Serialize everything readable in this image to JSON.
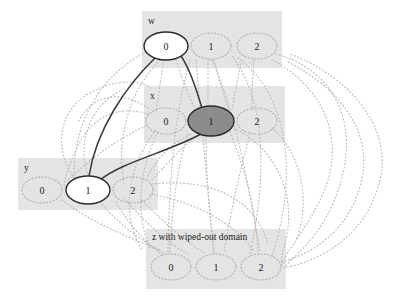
{
  "diagram": {
    "type": "constraint-graph",
    "title": "",
    "background_color": "#ffffff",
    "box_fill_color": "#e4e4e4",
    "dotted_edge_color": "#b9b9b9",
    "solid_edge_color": "#3a3a3a",
    "assigned_node_fill": "#ffffff",
    "highlight_node_fill": "#8c8c8c",
    "node_stroke_color": "#2a2a2a",
    "dotted_node_stroke_color": "#b0b0b0"
  },
  "variables": [
    {
      "id": "w",
      "label": "w",
      "label_x": 148,
      "label_y": 24,
      "box": {
        "x": 142,
        "y": 11,
        "w": 140,
        "h": 57
      },
      "values": [
        {
          "value": "0",
          "cx": 166,
          "cy": 46,
          "rx": 22,
          "ry": 14,
          "state": "assigned"
        },
        {
          "value": "1",
          "cx": 211,
          "cy": 46,
          "rx": 20,
          "ry": 13,
          "state": "available"
        },
        {
          "value": "2",
          "cx": 257,
          "cy": 46,
          "rx": 20,
          "ry": 13,
          "state": "available"
        }
      ]
    },
    {
      "id": "x",
      "label": "x",
      "label_x": 150,
      "label_y": 99,
      "box": {
        "x": 144,
        "y": 86,
        "w": 141,
        "h": 57
      },
      "values": [
        {
          "value": "0",
          "cx": 166,
          "cy": 121,
          "rx": 20,
          "ry": 13,
          "state": "available"
        },
        {
          "value": "1",
          "cx": 211,
          "cy": 121,
          "rx": 23,
          "ry": 15,
          "state": "highlighted"
        },
        {
          "value": "2",
          "cx": 257,
          "cy": 121,
          "rx": 20,
          "ry": 13,
          "state": "available"
        }
      ]
    },
    {
      "id": "y",
      "label": "y",
      "label_x": 24,
      "label_y": 171,
      "box": {
        "x": 18,
        "y": 158,
        "w": 140,
        "h": 52
      },
      "values": [
        {
          "value": "0",
          "cx": 42,
          "cy": 190,
          "rx": 20,
          "ry": 13,
          "state": "available"
        },
        {
          "value": "1",
          "cx": 88,
          "cy": 190,
          "rx": 22,
          "ry": 14,
          "state": "assigned"
        },
        {
          "value": "2",
          "cx": 133,
          "cy": 190,
          "rx": 20,
          "ry": 13,
          "state": "available"
        }
      ]
    },
    {
      "id": "z",
      "label": "z with wiped-out domain",
      "label_x": 152,
      "label_y": 240,
      "box": {
        "x": 146,
        "y": 229,
        "w": 140,
        "h": 60
      },
      "values": [
        {
          "value": "0",
          "cx": 171,
          "cy": 267,
          "rx": 20,
          "ry": 13,
          "state": "wiped"
        },
        {
          "value": "1",
          "cx": 216,
          "cy": 267,
          "rx": 20,
          "ry": 13,
          "state": "wiped"
        },
        {
          "value": "2",
          "cx": 261,
          "cy": 267,
          "rx": 20,
          "ry": 13,
          "state": "wiped"
        }
      ]
    }
  ],
  "solid_edges": [
    {
      "from": "w0",
      "to": "x1",
      "path": "M 181 56 C 192 72, 198 96, 202 108"
    },
    {
      "from": "w0",
      "to": "y1",
      "path": "M 155 58 C 126 86, 96 130, 89 176"
    },
    {
      "from": "x1",
      "to": "y1",
      "path": "M 201 134 C 168 152, 122 162, 100 180"
    }
  ],
  "dotted_edges": [
    {
      "path": "M 146 52 C 96 78, 74 126, 74 176"
    },
    {
      "path": "M 160 60 C 128 92, 116 140, 124 184"
    },
    {
      "path": "M 190 60 C 178 104, 170 150, 168 252"
    },
    {
      "path": "M 196 60 C 200 110, 206 170, 214 252"
    },
    {
      "path": "M 212 60 C 234 108, 248 180, 260 252"
    },
    {
      "path": "M 232 56 C 262 96, 270 160, 250 254"
    },
    {
      "path": "M 238 58 C 286 92, 300 170, 272 256"
    },
    {
      "path": "M 276 54 C 336 70, 368 130, 330 210 C 310 250, 282 264, 286 268"
    },
    {
      "path": "M 272 60 C 322 86, 350 140, 320 200 C 300 240, 280 258, 284 264"
    },
    {
      "path": "M 188 134 C 176 170, 172 212, 170 252"
    },
    {
      "path": "M 206 136 C 206 180, 210 220, 214 252"
    },
    {
      "path": "M 230 132 C 248 176, 256 216, 258 252"
    },
    {
      "path": "M 234 128 C 278 150, 296 196, 286 240 C 282 256, 280 262, 282 266"
    },
    {
      "path": "M 146 126 C 110 142, 86 164, 68 180"
    },
    {
      "path": "M 148 114 C 116 104, 90 118, 76 150 C 66 172, 64 184, 64 186"
    },
    {
      "path": "M 148 108 C 118 88, 92 96, 78 122"
    },
    {
      "path": "M 62 200 C 90 222, 130 238, 160 250"
    },
    {
      "path": "M 100 202 C 120 226, 146 244, 166 254"
    },
    {
      "path": "M 142 200 C 162 222, 190 244, 206 254"
    },
    {
      "path": "M 150 194 C 196 202, 236 224, 254 252"
    },
    {
      "path": "M 152 184 C 208 178, 254 196, 268 244"
    },
    {
      "path": "M 284 268 C 330 258, 368 230, 380 180 C 392 128, 352 78, 290 54"
    },
    {
      "path": "M 282 262 C 324 250, 354 220, 362 178 C 372 132, 340 88, 288 62"
    },
    {
      "path": "M 74 178 C 54 150, 58 112, 88 94 C 118 76, 146 82, 150 88"
    },
    {
      "path": "M 88 176 C 76 140, 92 104, 122 90"
    },
    {
      "path": "M 164 60 C 160 82, 158 100, 156 112"
    },
    {
      "path": "M 176 60 C 184 84, 190 100, 196 110"
    },
    {
      "path": "M 254 60 C 252 82, 252 100, 252 110"
    },
    {
      "path": "M 242 60 C 236 84, 234 100, 232 110"
    },
    {
      "path": "M 208 60 C 208 82, 208 98, 208 108"
    },
    {
      "path": "M 214 60 C 220 82, 224 98, 228 108"
    },
    {
      "path": "M 158 132 C 140 168, 134 212, 150 248"
    },
    {
      "path": "M 156 130 C 128 166, 120 214, 142 250"
    },
    {
      "path": "M 250 134 C 238 176, 230 218, 224 252"
    },
    {
      "path": "M 272 128 C 300 152, 312 200, 296 240"
    },
    {
      "path": "M 148 176 C 160 152, 180 138, 192 134"
    },
    {
      "path": "M 152 180 C 170 160, 186 144, 194 138"
    },
    {
      "path": "M 116 202 C 132 230, 152 248, 164 256"
    },
    {
      "path": "M 124 198 C 146 224, 172 246, 188 254"
    }
  ]
}
